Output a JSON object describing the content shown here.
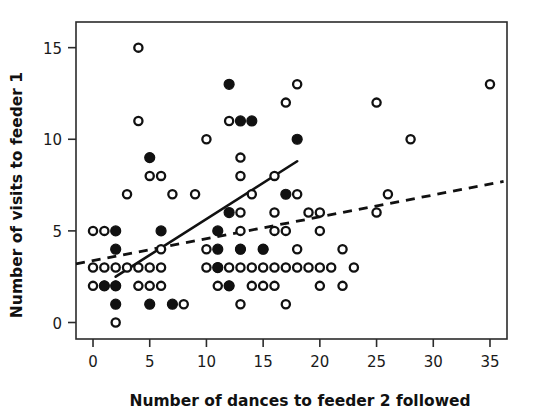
{
  "chart_data": {
    "type": "scatter",
    "title": "",
    "xlabel": "Number of dances to feeder 2 followed",
    "ylabel": "Number of visits to feeder 1",
    "xlim": [
      -1.5,
      36.5
    ],
    "ylim": [
      -0.9,
      16.4
    ],
    "xticks": [
      0,
      5,
      10,
      15,
      20,
      25,
      30,
      35
    ],
    "yticks": [
      0,
      5,
      10,
      15
    ],
    "xtick_labels": [
      "0",
      "5",
      "10",
      "15",
      "20",
      "25",
      "30",
      "35"
    ],
    "ytick_labels": [
      "0",
      "5",
      "10",
      "15"
    ],
    "grid": false,
    "legend": "none",
    "marker_colors": {
      "open": "#ffffff",
      "filled": "#111111",
      "edge": "#111111"
    },
    "series": [
      {
        "name": "open-circles",
        "marker": "open circle",
        "points": [
          [
            0,
            5
          ],
          [
            0,
            3
          ],
          [
            0,
            2
          ],
          [
            1,
            5
          ],
          [
            1,
            3
          ],
          [
            1,
            2
          ],
          [
            2,
            3
          ],
          [
            2,
            2
          ],
          [
            2,
            0
          ],
          [
            3,
            3
          ],
          [
            3,
            7
          ],
          [
            4,
            15
          ],
          [
            4,
            11
          ],
          [
            4,
            3
          ],
          [
            4,
            2
          ],
          [
            5,
            8
          ],
          [
            5,
            3
          ],
          [
            5,
            2
          ],
          [
            6,
            8
          ],
          [
            6,
            4
          ],
          [
            6,
            3
          ],
          [
            6,
            2
          ],
          [
            7,
            7
          ],
          [
            8,
            1
          ],
          [
            9,
            7
          ],
          [
            10,
            10
          ],
          [
            10,
            4
          ],
          [
            10,
            3
          ],
          [
            11,
            3
          ],
          [
            11,
            2
          ],
          [
            12,
            11
          ],
          [
            12,
            3
          ],
          [
            12,
            2
          ],
          [
            13,
            9
          ],
          [
            13,
            8
          ],
          [
            13,
            6
          ],
          [
            13,
            5
          ],
          [
            13,
            4
          ],
          [
            13,
            3
          ],
          [
            13,
            1
          ],
          [
            14,
            7
          ],
          [
            14,
            3
          ],
          [
            14,
            2
          ],
          [
            15,
            4
          ],
          [
            15,
            3
          ],
          [
            15,
            2
          ],
          [
            16,
            8
          ],
          [
            16,
            6
          ],
          [
            16,
            5
          ],
          [
            16,
            3
          ],
          [
            16,
            2
          ],
          [
            17,
            12
          ],
          [
            17,
            5
          ],
          [
            17,
            3
          ],
          [
            17,
            1
          ],
          [
            18,
            13
          ],
          [
            18,
            7
          ],
          [
            18,
            4
          ],
          [
            18,
            3
          ],
          [
            19,
            6
          ],
          [
            19,
            3
          ],
          [
            20,
            6
          ],
          [
            20,
            5
          ],
          [
            20,
            3
          ],
          [
            20,
            2
          ],
          [
            21,
            3
          ],
          [
            22,
            4
          ],
          [
            22,
            2
          ],
          [
            23,
            3
          ],
          [
            25,
            12
          ],
          [
            25,
            6
          ],
          [
            26,
            7
          ],
          [
            28,
            10
          ],
          [
            35,
            13
          ]
        ]
      },
      {
        "name": "filled-circles",
        "marker": "filled circle",
        "points": [
          [
            1,
            2
          ],
          [
            2,
            5
          ],
          [
            2,
            4
          ],
          [
            2,
            2
          ],
          [
            2,
            1
          ],
          [
            5,
            9
          ],
          [
            5,
            1
          ],
          [
            6,
            5
          ],
          [
            7,
            1
          ],
          [
            11,
            5
          ],
          [
            11,
            4
          ],
          [
            11,
            3
          ],
          [
            12,
            13
          ],
          [
            12,
            6
          ],
          [
            12,
            2
          ],
          [
            13,
            11
          ],
          [
            13,
            4
          ],
          [
            14,
            11
          ],
          [
            15,
            4
          ],
          [
            17,
            7
          ],
          [
            18,
            10
          ]
        ]
      }
    ],
    "fit_lines": [
      {
        "name": "solid-regression-line",
        "style": "solid",
        "x_start": 2.0,
        "y_start": 2.5,
        "x_end": 18.0,
        "y_end": 8.8
      },
      {
        "name": "dashed-regression-line",
        "style": "dashed",
        "x_start": -1.5,
        "y_start": 3.2,
        "x_end": 36.2,
        "y_end": 7.7
      }
    ]
  }
}
